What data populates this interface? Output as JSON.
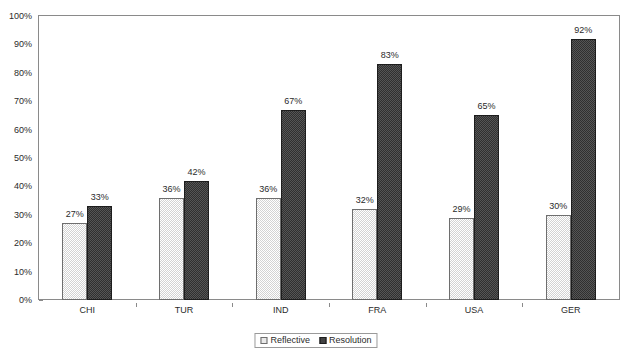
{
  "chart_data": {
    "type": "bar",
    "title": "",
    "subtitle": "",
    "xlabel": "",
    "ylabel": "",
    "categories": [
      "CHI",
      "TUR",
      "IND",
      "FRA",
      "USA",
      "GER"
    ],
    "series": [
      {
        "name": "Reflective",
        "values": [
          27,
          36,
          36,
          32,
          29,
          30
        ],
        "labels": [
          "27%",
          "36%",
          "36%",
          "32%",
          "29%",
          "30%"
        ],
        "color": "#d3d3d3",
        "pattern": "light-checker"
      },
      {
        "name": "Resolution",
        "values": [
          33,
          42,
          67,
          83,
          65,
          92
        ],
        "labels": [
          "33%",
          "42%",
          "67%",
          "83%",
          "65%",
          "92%"
        ],
        "color": "#303030",
        "pattern": "dark-checker"
      }
    ],
    "ylim": [
      0,
      100
    ],
    "ytick_step": 10,
    "ytick_labels": [
      "0%",
      "10%",
      "20%",
      "30%",
      "40%",
      "50%",
      "60%",
      "70%",
      "80%",
      "90%",
      "100%"
    ],
    "value_suffix": "%",
    "grid": false,
    "frame": true,
    "legend_position": "bottom-center",
    "legend_entries": [
      "Reflective",
      "Resolution"
    ]
  },
  "axes": {
    "frame_color": "#8a8a8a",
    "tick_color": "#8a8a8a",
    "text_color": "#2b2b2b"
  },
  "background": {
    "page_color": "#ffffff",
    "plot_color": "#ffffff"
  }
}
